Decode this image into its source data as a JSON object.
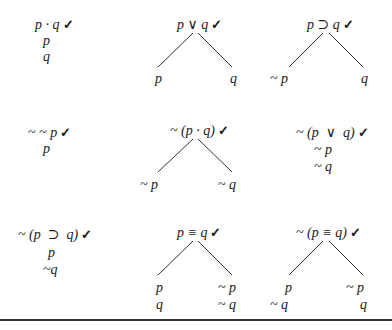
{
  "check_mark": "✓",
  "rules": [
    {
      "id": "conjunction",
      "root": "p · q",
      "type": "stack",
      "lines": [
        "p",
        "q"
      ]
    },
    {
      "id": "disjunction",
      "root": "p ∨ q",
      "type": "branch",
      "left": [
        "p"
      ],
      "right": [
        "q"
      ]
    },
    {
      "id": "conditional",
      "root": "p ⊃ q",
      "type": "branch",
      "left": [
        "~ p"
      ],
      "right": [
        "q"
      ]
    },
    {
      "id": "double-negation",
      "root": "~ ~ p",
      "type": "stack",
      "lines": [
        "p"
      ]
    },
    {
      "id": "negated-conjunction",
      "root": "~ (p · q)",
      "type": "branch",
      "left": [
        "~ p"
      ],
      "right": [
        "~ q"
      ]
    },
    {
      "id": "negated-disjunction",
      "root": "~ (p  ∨  q)",
      "type": "stack",
      "lines": [
        "~ p",
        "~ q"
      ]
    },
    {
      "id": "negated-conditional",
      "root": "~ (p  ⊃  q)",
      "type": "stack",
      "lines": [
        "p",
        "~q"
      ]
    },
    {
      "id": "biconditional",
      "root": "p ≡ q",
      "type": "branch",
      "left": [
        "p",
        "q"
      ],
      "right": [
        "~ p",
        "~ q"
      ]
    },
    {
      "id": "negated-biconditional",
      "root": "~ (p ≡ q)",
      "type": "branch",
      "left": [
        "p",
        "~ q"
      ],
      "right": [
        "~ p",
        "q"
      ]
    }
  ]
}
